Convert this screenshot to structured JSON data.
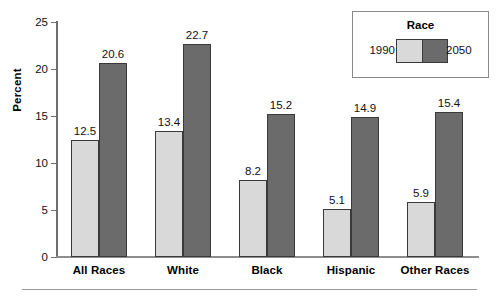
{
  "chart_data": {
    "type": "bar",
    "title": "",
    "xlabel": "",
    "ylabel": "Percent",
    "ylim": [
      0,
      25
    ],
    "yticks": [
      0,
      5,
      10,
      15,
      20,
      25
    ],
    "grid": false,
    "legend_position": "top-right",
    "legend_title": "Race",
    "categories": [
      "All Races",
      "White",
      "Black",
      "Hispanic",
      "Other Races"
    ],
    "series": [
      {
        "name": "1990",
        "color": "#d9d9d9",
        "values": [
          12.5,
          13.4,
          8.2,
          5.1,
          5.9
        ]
      },
      {
        "name": "2050",
        "color": "#6b6b6b",
        "values": [
          20.6,
          22.7,
          15.2,
          14.9,
          15.4
        ]
      }
    ],
    "value_labels": [
      [
        "12.5",
        "20.6"
      ],
      [
        "13.4",
        "22.7"
      ],
      [
        "8.2",
        "15.2"
      ],
      [
        "5.1",
        "14.9"
      ],
      [
        "5.9",
        "15.4"
      ]
    ]
  },
  "legend": {
    "title": "Race",
    "left_label": "1990",
    "right_label": "2050"
  },
  "axes": {
    "ylabel": "Percent",
    "yticks": [
      "0",
      "5",
      "10",
      "15",
      "20",
      "25"
    ]
  }
}
